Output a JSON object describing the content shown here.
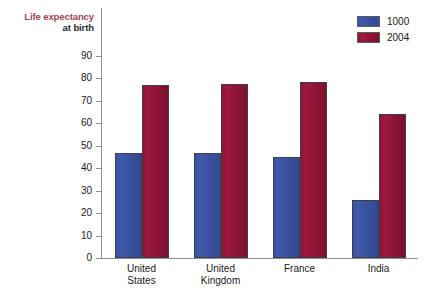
{
  "chart_data": {
    "type": "bar",
    "title": "Life expectancy at birth",
    "title_line1": "Life expectancy",
    "title_line2": "at birth",
    "xlabel": "",
    "ylabel": "",
    "ylim": [
      0,
      90
    ],
    "grid": false,
    "legend_position": "top-right",
    "categories": [
      "United States",
      "United Kingdom",
      "France",
      "India"
    ],
    "category_lines": [
      [
        "United",
        "States"
      ],
      [
        "United",
        "Kingdom"
      ],
      [
        "France",
        ""
      ],
      [
        "India",
        ""
      ]
    ],
    "y_ticks": [
      0,
      10,
      20,
      30,
      40,
      50,
      60,
      70,
      80,
      90
    ],
    "y_tick_labels": [
      "0",
      "10",
      "20",
      "30",
      "40",
      "50",
      "60",
      "70",
      "80",
      "90"
    ],
    "series": [
      {
        "name": "1000",
        "color": "#3a54a0",
        "values": [
          47,
          47,
          45,
          26
        ]
      },
      {
        "name": "2004",
        "color": "#8e1436",
        "values": [
          77,
          77.5,
          78.5,
          64
        ]
      }
    ]
  },
  "legend": {
    "items": [
      {
        "label": "1000",
        "color": "#3a54a0"
      },
      {
        "label": "2004",
        "color": "#8e1436"
      }
    ]
  },
  "colors": {
    "series_1000": "#3a54a0",
    "series_2004": "#8e1436",
    "title_accent": "#9e4552",
    "axis": "#8c8c99",
    "text": "#1a1a1a",
    "background": "#ffffff"
  }
}
